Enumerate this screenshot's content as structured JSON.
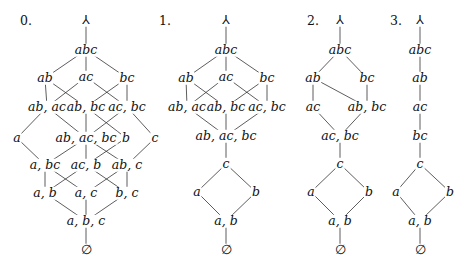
{
  "diagrams": [
    {
      "label": "0.",
      "label_pos": [
        26,
        21
      ],
      "nodes": [
        {
          "id": "top",
          "text": "⅄",
          "x": 86,
          "y": 20
        },
        {
          "id": "abc",
          "text": "abc",
          "x": 86,
          "y": 50
        },
        {
          "id": "ab",
          "text": "ab",
          "x": 45,
          "y": 78
        },
        {
          "id": "ac",
          "text": "ac",
          "x": 86,
          "y": 77
        },
        {
          "id": "bc",
          "text": "bc",
          "x": 127,
          "y": 78
        },
        {
          "id": "ab_ac",
          "text": "ab, ac",
          "x": 47,
          "y": 107
        },
        {
          "id": "ab_bc",
          "text": "ab, bc",
          "x": 86,
          "y": 107
        },
        {
          "id": "ac_bc",
          "text": "ac, bc",
          "x": 127,
          "y": 107
        },
        {
          "id": "a",
          "text": "a",
          "x": 17,
          "y": 138
        },
        {
          "id": "ab_ac_bc",
          "text": "ab, ac, bc",
          "x": 86,
          "y": 138
        },
        {
          "id": "b",
          "text": "b",
          "x": 126,
          "y": 138
        },
        {
          "id": "c",
          "text": "c",
          "x": 155,
          "y": 138
        },
        {
          "id": "a_bc",
          "text": "a, bc",
          "x": 45,
          "y": 165
        },
        {
          "id": "ac_b",
          "text": "ac, b",
          "x": 86,
          "y": 165
        },
        {
          "id": "ab_c",
          "text": "ab, c",
          "x": 127,
          "y": 165
        },
        {
          "id": "a_b",
          "text": "a, b",
          "x": 45,
          "y": 193
        },
        {
          "id": "a_c",
          "text": "a, c",
          "x": 86,
          "y": 193
        },
        {
          "id": "b_c",
          "text": "b, c",
          "x": 127,
          "y": 193
        },
        {
          "id": "a_b_c",
          "text": "a, b, c",
          "x": 86,
          "y": 221
        },
        {
          "id": "empty",
          "text": "∅",
          "x": 86,
          "y": 250
        }
      ],
      "edges": [
        [
          "top",
          "abc"
        ],
        [
          "abc",
          "ab"
        ],
        [
          "abc",
          "ac"
        ],
        [
          "abc",
          "bc"
        ],
        [
          "ab",
          "ab_ac"
        ],
        [
          "ab",
          "ab_bc"
        ],
        [
          "ac",
          "ab_ac"
        ],
        [
          "ac",
          "ac_bc"
        ],
        [
          "bc",
          "ab_bc"
        ],
        [
          "bc",
          "ac_bc"
        ],
        [
          "ab_ac",
          "ab_ac_bc"
        ],
        [
          "ab_ac",
          "a"
        ],
        [
          "ab_bc",
          "ab_ac_bc"
        ],
        [
          "ab_bc",
          "b"
        ],
        [
          "ac_bc",
          "ab_ac_bc"
        ],
        [
          "ac_bc",
          "c"
        ],
        [
          "a",
          "a_bc"
        ],
        [
          "ab_ac_bc",
          "a_bc"
        ],
        [
          "ab_ac_bc",
          "ac_b"
        ],
        [
          "ab_ac_bc",
          "ab_c"
        ],
        [
          "b",
          "ac_b"
        ],
        [
          "c",
          "ab_c"
        ],
        [
          "a_bc",
          "a_b"
        ],
        [
          "a_bc",
          "a_c"
        ],
        [
          "ac_b",
          "a_b"
        ],
        [
          "ac_b",
          "b_c"
        ],
        [
          "ab_c",
          "a_c"
        ],
        [
          "ab_c",
          "b_c"
        ],
        [
          "a_b",
          "a_b_c"
        ],
        [
          "a_c",
          "a_b_c"
        ],
        [
          "b_c",
          "a_b_c"
        ],
        [
          "a_b_c",
          "empty"
        ]
      ]
    },
    {
      "label": "1.",
      "label_pos": [
        165,
        21
      ],
      "nodes": [
        {
          "id": "top",
          "text": "⅄",
          "x": 226,
          "y": 20
        },
        {
          "id": "abc",
          "text": "abc",
          "x": 226,
          "y": 50
        },
        {
          "id": "ab",
          "text": "ab",
          "x": 186,
          "y": 78
        },
        {
          "id": "ac",
          "text": "ac",
          "x": 226,
          "y": 77
        },
        {
          "id": "bc",
          "text": "bc",
          "x": 267,
          "y": 78
        },
        {
          "id": "ab_ac",
          "text": "ab, ac",
          "x": 187,
          "y": 107
        },
        {
          "id": "ab_bc",
          "text": "ab, bc",
          "x": 226,
          "y": 107
        },
        {
          "id": "ac_bc",
          "text": "ac, bc",
          "x": 267,
          "y": 107
        },
        {
          "id": "ab_ac_bc",
          "text": "ab, ac, bc",
          "x": 226,
          "y": 136
        },
        {
          "id": "c",
          "text": "c",
          "x": 226,
          "y": 164
        },
        {
          "id": "a",
          "text": "a",
          "x": 197,
          "y": 192
        },
        {
          "id": "b",
          "text": "b",
          "x": 256,
          "y": 192
        },
        {
          "id": "a_b",
          "text": "a, b",
          "x": 226,
          "y": 221
        },
        {
          "id": "empty",
          "text": "∅",
          "x": 226,
          "y": 250
        }
      ],
      "edges": [
        [
          "top",
          "abc"
        ],
        [
          "abc",
          "ab"
        ],
        [
          "abc",
          "ac"
        ],
        [
          "abc",
          "bc"
        ],
        [
          "ab",
          "ab_ac"
        ],
        [
          "ab",
          "ab_bc"
        ],
        [
          "ac",
          "ab_ac"
        ],
        [
          "ac",
          "ac_bc"
        ],
        [
          "bc",
          "ab_bc"
        ],
        [
          "bc",
          "ac_bc"
        ],
        [
          "ab_ac",
          "ab_ac_bc"
        ],
        [
          "ab_bc",
          "ab_ac_bc"
        ],
        [
          "ac_bc",
          "ab_ac_bc"
        ],
        [
          "ab_ac_bc",
          "c"
        ],
        [
          "c",
          "a"
        ],
        [
          "c",
          "b"
        ],
        [
          "a",
          "a_b"
        ],
        [
          "b",
          "a_b"
        ],
        [
          "a_b",
          "empty"
        ]
      ]
    },
    {
      "label": "2.",
      "label_pos": [
        313,
        21
      ],
      "nodes": [
        {
          "id": "top",
          "text": "⅄",
          "x": 340,
          "y": 20
        },
        {
          "id": "abc",
          "text": "abc",
          "x": 340,
          "y": 50
        },
        {
          "id": "ab",
          "text": "ab",
          "x": 313,
          "y": 78
        },
        {
          "id": "bc",
          "text": "bc",
          "x": 367,
          "y": 78
        },
        {
          "id": "ac",
          "text": "ac",
          "x": 313,
          "y": 107
        },
        {
          "id": "ab_bc",
          "text": "ab, bc",
          "x": 367,
          "y": 107
        },
        {
          "id": "ac_bc",
          "text": "ac, bc",
          "x": 340,
          "y": 136
        },
        {
          "id": "c",
          "text": "c",
          "x": 340,
          "y": 164
        },
        {
          "id": "a",
          "text": "a",
          "x": 311,
          "y": 192
        },
        {
          "id": "b",
          "text": "b",
          "x": 369,
          "y": 192
        },
        {
          "id": "a_b",
          "text": "a, b",
          "x": 340,
          "y": 221
        },
        {
          "id": "empty",
          "text": "∅",
          "x": 340,
          "y": 250
        }
      ],
      "edges": [
        [
          "top",
          "abc"
        ],
        [
          "abc",
          "ab"
        ],
        [
          "abc",
          "bc"
        ],
        [
          "ab",
          "ac"
        ],
        [
          "ab",
          "ab_bc"
        ],
        [
          "bc",
          "ab_bc"
        ],
        [
          "ac",
          "ac_bc"
        ],
        [
          "ab_bc",
          "ac_bc"
        ],
        [
          "ac_bc",
          "c"
        ],
        [
          "c",
          "a"
        ],
        [
          "c",
          "b"
        ],
        [
          "a",
          "a_b"
        ],
        [
          "b",
          "a_b"
        ],
        [
          "a_b",
          "empty"
        ]
      ]
    },
    {
      "label": "3.",
      "label_pos": [
        396,
        21
      ],
      "nodes": [
        {
          "id": "top",
          "text": "⅄",
          "x": 420,
          "y": 20
        },
        {
          "id": "abc",
          "text": "abc",
          "x": 420,
          "y": 50
        },
        {
          "id": "ab",
          "text": "ab",
          "x": 420,
          "y": 78
        },
        {
          "id": "ac",
          "text": "ac",
          "x": 420,
          "y": 107
        },
        {
          "id": "bc",
          "text": "bc",
          "x": 420,
          "y": 136
        },
        {
          "id": "c",
          "text": "c",
          "x": 420,
          "y": 164
        },
        {
          "id": "a",
          "text": "a",
          "x": 396,
          "y": 192
        },
        {
          "id": "b",
          "text": "b",
          "x": 450,
          "y": 192
        },
        {
          "id": "a_b",
          "text": "a, b",
          "x": 420,
          "y": 221
        },
        {
          "id": "empty",
          "text": "∅",
          "x": 420,
          "y": 250
        }
      ],
      "edges": [
        [
          "top",
          "abc"
        ],
        [
          "abc",
          "ab"
        ],
        [
          "ab",
          "ac"
        ],
        [
          "ac",
          "bc"
        ],
        [
          "bc",
          "c"
        ],
        [
          "c",
          "a"
        ],
        [
          "c",
          "b"
        ],
        [
          "a",
          "a_b"
        ],
        [
          "b",
          "a_b"
        ],
        [
          "a_b",
          "empty"
        ]
      ]
    }
  ]
}
